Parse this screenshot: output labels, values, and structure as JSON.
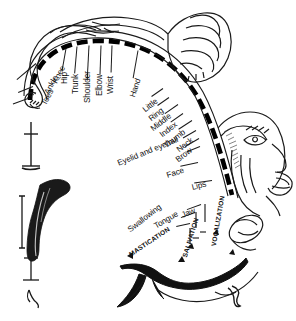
{
  "figure": {
    "background_color": "#ffffff",
    "ink_color": "#111111",
    "strip_color": "#000000"
  },
  "labels": {
    "body": [
      {
        "text": "Toes",
        "x": 44,
        "y": 101,
        "rot": -62,
        "lx": 28,
        "ly": 98,
        "llen": 16,
        "lrot": 160
      },
      {
        "text": "Ankle",
        "x": 47,
        "y": 90,
        "rot": -62,
        "lx": 33,
        "ly": 86,
        "llen": 16,
        "lrot": 158
      },
      {
        "text": "Knee",
        "x": 55,
        "y": 79,
        "rot": -62,
        "lx": 36,
        "ly": 63,
        "llen": 25,
        "lrot": 140
      },
      {
        "text": "Hip",
        "x": 65,
        "y": 80,
        "rot": -90,
        "lx": 66,
        "ly": 48,
        "llen": 23,
        "lrot": 100
      },
      {
        "text": "Trunk",
        "x": 76,
        "y": 90,
        "rot": -90,
        "lx": 77,
        "ly": 46,
        "llen": 27,
        "lrot": 95
      },
      {
        "text": "Shoulder",
        "x": 88,
        "y": 99,
        "rot": -90,
        "lx": 89,
        "ly": 45,
        "llen": 35,
        "lrot": 93
      },
      {
        "text": "Elbow",
        "x": 100,
        "y": 92,
        "rot": -90,
        "lx": 101,
        "ly": 45,
        "llen": 29,
        "lrot": 92
      },
      {
        "text": "Wrist",
        "x": 111,
        "y": 90,
        "rot": -90,
        "lx": 112,
        "ly": 45,
        "llen": 27,
        "lrot": 92
      },
      {
        "text": "Hand",
        "x": 133,
        "y": 93,
        "rot": -72,
        "lx": 138,
        "ly": 50,
        "llen": 28,
        "lrot": 100
      },
      {
        "text": "Little",
        "x": 144,
        "y": 107,
        "rot": -38,
        "lx": 163,
        "ly": 88,
        "llen": 14,
        "lrot": 145
      },
      {
        "text": "Ring",
        "x": 150,
        "y": 116,
        "rot": -38,
        "lx": 169,
        "ly": 97,
        "llen": 14,
        "lrot": 145
      },
      {
        "text": "Middle",
        "x": 152,
        "y": 126,
        "rot": -38,
        "lx": 178,
        "ly": 104,
        "llen": 16,
        "lrot": 145
      },
      {
        "text": "Index",
        "x": 161,
        "y": 132,
        "rot": -38,
        "lx": 183,
        "ly": 113,
        "llen": 15,
        "lrot": 145
      },
      {
        "text": "Thumb",
        "x": 165,
        "y": 143,
        "rot": -38,
        "lx": 192,
        "ly": 120,
        "llen": 16,
        "lrot": 147
      },
      {
        "text": "Neck",
        "x": 178,
        "y": 147,
        "rot": -38,
        "lx": 196,
        "ly": 130,
        "llen": 15,
        "lrot": 150
      },
      {
        "text": "Brow",
        "x": 177,
        "y": 157,
        "rot": -38,
        "lx": 199,
        "ly": 138,
        "llen": 16,
        "lrot": 150
      },
      {
        "text": "Eyelid and eyeball",
        "x": 118,
        "y": 160,
        "rot": -22,
        "lx": 200,
        "ly": 146,
        "llen": 14,
        "lrot": 158
      },
      {
        "text": "Face",
        "x": 167,
        "y": 172,
        "rot": -18,
        "lx": 198,
        "ly": 162,
        "llen": 18,
        "lrot": 168
      },
      {
        "text": "Lips",
        "x": 192,
        "y": 184,
        "rot": -14,
        "lx": 212,
        "ly": 180,
        "llen": 18,
        "lrot": 172
      },
      {
        "text": "Jaw",
        "x": 182,
        "y": 212,
        "rot": -22,
        "lx": 201,
        "ly": 204,
        "llen": 15,
        "lrot": 160
      },
      {
        "text": "Tongue",
        "x": 155,
        "y": 223,
        "rot": -30,
        "lx": 195,
        "ly": 212,
        "llen": 15,
        "lrot": 160
      },
      {
        "text": "Swallowing",
        "x": 129,
        "y": 227,
        "rot": -38,
        "lx": 190,
        "ly": 223,
        "llen": 14,
        "lrot": 168
      }
    ],
    "functions": [
      {
        "text": "MASTICATION",
        "x": 130,
        "y": 252,
        "rot": -34
      },
      {
        "text": "SALIVATION",
        "x": 185,
        "y": 254,
        "rot": -73
      },
      {
        "text": "VOCALIZATION",
        "x": 214,
        "y": 243,
        "rot": -80
      }
    ]
  }
}
